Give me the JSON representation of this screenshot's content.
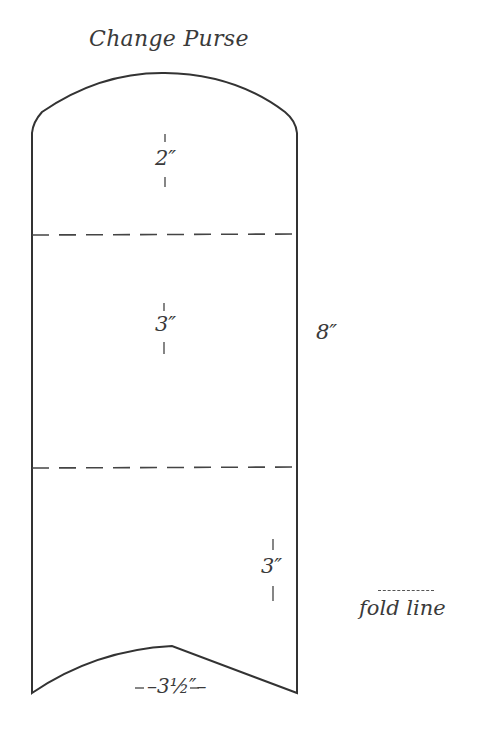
{
  "title": "Change Purse",
  "dimensions": {
    "top_flap": "2″",
    "middle_section": "3″",
    "bottom_section": "3″",
    "total_height": "8″",
    "width": "–3½″–"
  },
  "legend": {
    "fold_line_label": "fold line"
  },
  "colors": {
    "line": "#333333",
    "background": "#ffffff"
  }
}
